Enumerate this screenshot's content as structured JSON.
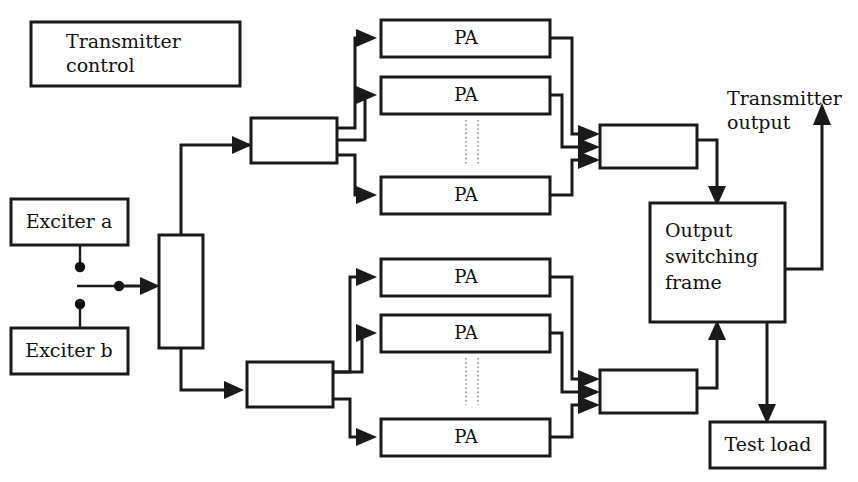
{
  "diagram": {
    "colors": {
      "line": "#1a1a1a",
      "background": "#ffffff",
      "dotted_divider": "#8c8c8c"
    },
    "blocks": {
      "transmitter_control": "Transmitter\ncontrol",
      "transmitter_control_line1": "Transmitter",
      "transmitter_control_line2": "control",
      "exciter_a": "Exciter a",
      "exciter_b": "Exciter b",
      "exciter_selector": "",
      "splitter_top": "",
      "splitter_bottom": "",
      "combiner_top": "",
      "combiner_bottom": "",
      "output_switching_frame_line1": "Output",
      "output_switching_frame_line2": "switching",
      "output_switching_frame_line3": "frame",
      "test_load": "Test load",
      "pa": "PA"
    },
    "pa_top": [
      {
        "label": "PA"
      },
      {
        "label": "PA"
      },
      {
        "label": "PA"
      }
    ],
    "pa_bottom": [
      {
        "label": "PA"
      },
      {
        "label": "PA"
      },
      {
        "label": "PA"
      }
    ],
    "labels": {
      "transmitter_output_line1": "Transmitter",
      "transmitter_output_line2": "output"
    }
  }
}
